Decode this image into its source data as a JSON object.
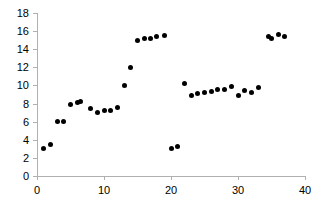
{
  "chart_data": {
    "type": "scatter",
    "title": "",
    "subtitle": "",
    "xlabel": "",
    "ylabel": "",
    "xlim": [
      0,
      40
    ],
    "ylim": [
      0,
      18
    ],
    "xticks": [
      0,
      10,
      20,
      30,
      40
    ],
    "yticks": [
      0,
      2,
      4,
      6,
      8,
      10,
      12,
      14,
      16,
      18
    ],
    "xtick_labels": [
      "0",
      "10",
      "20",
      "30",
      "40"
    ],
    "ytick_labels": [
      "0",
      "2",
      "4",
      "6",
      "8",
      "10",
      "12",
      "14",
      "16",
      "18"
    ],
    "grid": false,
    "legend": null,
    "legend_position": "none",
    "marker": "filled-circle",
    "marker_color": "#000000",
    "marker_size_px": 5,
    "axis_color": "#b0b0b0",
    "series": [
      {
        "name": "series-1",
        "points": [
          [
            1,
            3.0
          ],
          [
            2,
            3.5
          ],
          [
            3,
            6.0
          ],
          [
            4,
            6.0
          ],
          [
            5,
            7.9
          ],
          [
            6,
            8.1
          ],
          [
            6.5,
            8.25
          ],
          [
            8,
            7.4
          ],
          [
            9,
            7.0
          ],
          [
            10,
            7.25
          ],
          [
            11,
            7.25
          ],
          [
            12,
            7.6
          ],
          [
            13,
            10.0
          ],
          [
            14,
            12.0
          ],
          [
            15,
            15.0
          ],
          [
            16,
            15.2
          ],
          [
            17,
            15.2
          ],
          [
            17.8,
            15.35
          ],
          [
            19,
            15.5
          ],
          [
            20,
            3.0
          ],
          [
            21,
            3.25
          ],
          [
            22,
            10.2
          ],
          [
            23,
            8.9
          ],
          [
            24,
            9.1
          ],
          [
            25,
            9.2
          ],
          [
            26,
            9.3
          ],
          [
            27,
            9.5
          ],
          [
            28,
            9.55
          ],
          [
            29,
            9.85
          ],
          [
            30,
            8.9
          ],
          [
            31,
            9.45
          ],
          [
            32,
            9.2
          ],
          [
            33,
            9.8
          ],
          [
            34.5,
            15.35
          ],
          [
            35,
            15.2
          ],
          [
            36,
            15.6
          ],
          [
            37,
            15.45
          ]
        ]
      }
    ]
  }
}
